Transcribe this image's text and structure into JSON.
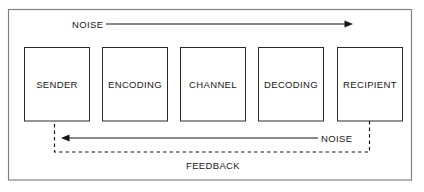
{
  "diagram": {
    "frame": {
      "name": "outer-frame"
    },
    "nodes": [
      {
        "id": "sender",
        "label": "SENDER"
      },
      {
        "id": "encoding",
        "label": "ENCODING"
      },
      {
        "id": "channel",
        "label": "CHANNEL"
      },
      {
        "id": "decoding",
        "label": "DECODING"
      },
      {
        "id": "recipient",
        "label": "RECIPIENT"
      }
    ],
    "edges": [
      {
        "id": "noise-top",
        "label": "NOISE",
        "style": "solid",
        "direction": "left-to-right",
        "from": "sender",
        "to": "recipient"
      },
      {
        "id": "noise-bottom",
        "label": "NOISE",
        "style": "solid",
        "direction": "right-to-left",
        "from": "recipient",
        "to": "sender"
      },
      {
        "id": "feedback",
        "label": "FEEDBACK",
        "style": "dashed",
        "direction": "right-to-left",
        "from": "recipient",
        "to": "sender"
      }
    ],
    "colors": {
      "background": "#ffffff",
      "frame_stroke": "#7d7d7d",
      "box_stroke": "#2b2b2b",
      "line_stroke": "#141414",
      "text": "#171717"
    }
  }
}
